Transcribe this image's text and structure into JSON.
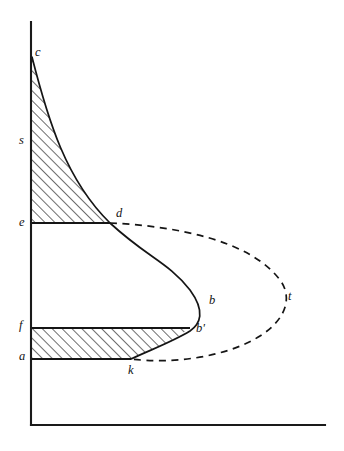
{
  "figure": {
    "type": "line-diagram",
    "title": "",
    "background_color": "#ffffff",
    "ink_color": "#151515",
    "canvas": {
      "width": 344,
      "height": 451
    }
  },
  "axes": {
    "vertical": {
      "x": 31,
      "y_top": 22,
      "y_bottom": 425
    },
    "horizontal": {
      "y": 425,
      "x_left": 31,
      "x_right": 325
    }
  },
  "labels": {
    "c": "c",
    "s": "s",
    "e": "e",
    "d": "d",
    "b": "b",
    "t": "t",
    "f": "f",
    "b_prime": "b'",
    "a": "a",
    "k": "k"
  },
  "label_positions": {
    "c": {
      "x": 35,
      "y": 46
    },
    "s": {
      "x": 19,
      "y": 134
    },
    "e": {
      "x": 19,
      "y": 216
    },
    "d": {
      "x": 116,
      "y": 207
    },
    "b": {
      "x": 209,
      "y": 294
    },
    "t": {
      "x": 288,
      "y": 290
    },
    "f": {
      "x": 19,
      "y": 319
    },
    "b_prime": {
      "x": 196,
      "y": 322
    },
    "a": {
      "x": 19,
      "y": 350
    },
    "k": {
      "x": 128,
      "y": 364
    }
  },
  "points": {
    "c": {
      "x": 32,
      "y": 57
    },
    "s": {
      "x": 32,
      "y": 141
    },
    "e": {
      "x": 32,
      "y": 223
    },
    "d": {
      "x": 110,
      "y": 223
    },
    "b": {
      "x": 205,
      "y": 303
    },
    "t": {
      "x": 283,
      "y": 299
    },
    "f": {
      "x": 32,
      "y": 328
    },
    "b_prime": {
      "x": 190,
      "y": 328
    },
    "a": {
      "x": 32,
      "y": 359
    },
    "k": {
      "x": 131,
      "y": 359
    }
  },
  "regions": {
    "upper_hatched": {
      "name": "upper-shaded-region",
      "description": "region bounded by vertical axis, curve c-d, and line e-d",
      "hatch_angle_deg": 45,
      "hatch_spacing_px": 7
    },
    "lower_hatched": {
      "name": "lower-shaded-band",
      "description": "band bounded by line f-b', curve b'-k, line a-k and vertical axis",
      "hatch_angle_deg": 45,
      "hatch_spacing_px": 7
    }
  },
  "curves": {
    "solid_curve": {
      "name": "solid-profile-curve",
      "style": "solid",
      "path": "M 32 57 C 48 120, 66 180, 110 223 C 148 258, 168 262, 190 290 C 206 312, 200 324, 190 331 C 172 342, 150 350, 131 359"
    },
    "dashed_curve": {
      "name": "dashed-profile-curve",
      "style": "dashed",
      "path": "M 110 223 C 175 226, 250 240, 280 280 C 292 296, 288 318, 260 336 C 225 358, 170 364, 131 359"
    }
  }
}
